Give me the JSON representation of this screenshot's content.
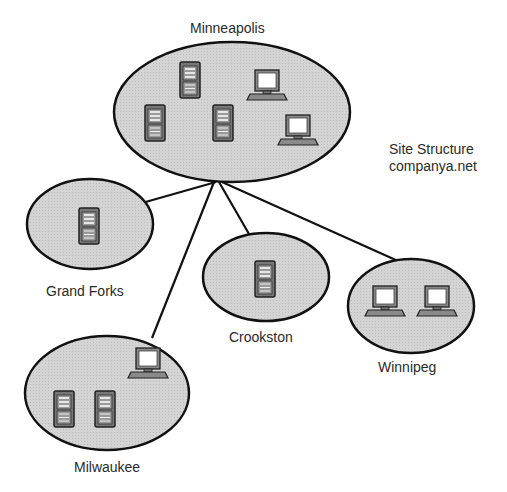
{
  "diagram": {
    "title": "Site Structure",
    "domain_name": "companya.net",
    "colors": {
      "site_fill": "#d2d2d2",
      "outline": "#111111",
      "server_body": "#7a7a7a",
      "monitor_screen": "#ffffff"
    },
    "hub": "Minneapolis",
    "sites": [
      {
        "name": "Minneapolis",
        "servers": 3,
        "workstations": 2
      },
      {
        "name": "Grand Forks",
        "servers": 1,
        "workstations": 0
      },
      {
        "name": "Crookston",
        "servers": 1,
        "workstations": 0
      },
      {
        "name": "Winnipeg",
        "servers": 0,
        "workstations": 2
      },
      {
        "name": "Milwaukee",
        "servers": 2,
        "workstations": 1
      }
    ],
    "links": [
      {
        "from": "Minneapolis",
        "to": "Grand Forks"
      },
      {
        "from": "Minneapolis",
        "to": "Milwaukee"
      },
      {
        "from": "Minneapolis",
        "to": "Crookston"
      },
      {
        "from": "Minneapolis",
        "to": "Winnipeg"
      }
    ]
  }
}
